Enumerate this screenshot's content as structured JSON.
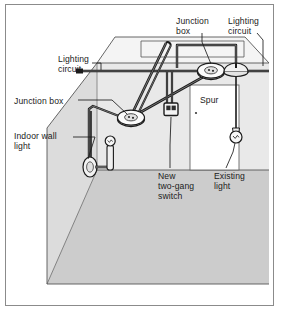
{
  "diagram": {
    "type": "isometric electrical installation diagram",
    "frame": {
      "border_color": "#8b8b8b",
      "background_color": "#ffffff"
    },
    "colors": {
      "wall_left": "#dcdcdc",
      "wall_back": "#e8e8e8",
      "floor": "#cccccc",
      "ceiling": "#f2f2f2",
      "line": "#1b1b1b",
      "cable": "#2a2a2a",
      "text": "#1b1b1b",
      "door_panel": "#ffffff"
    },
    "labels": [
      {
        "id": "junction-box-ceiling",
        "text": "Junction\nbox",
        "x": 176,
        "y": 16,
        "align": "left"
      },
      {
        "id": "lighting-circuit-right",
        "text": "Lighting\ncircuit",
        "x": 228,
        "y": 16,
        "align": "left"
      },
      {
        "id": "lighting-circuit-left",
        "text": "Lighting\ncircuit",
        "x": 58,
        "y": 54,
        "align": "left"
      },
      {
        "id": "junction-box-wall",
        "text": "Junction box",
        "x": 14,
        "y": 96,
        "align": "left"
      },
      {
        "id": "spur",
        "text": "Spur",
        "x": 200,
        "y": 95,
        "align": "left"
      },
      {
        "id": "indoor-wall-light",
        "text": "Indoor wall\nlight",
        "x": 14,
        "y": 131,
        "align": "left"
      },
      {
        "id": "new-two-gang-switch",
        "text": "New\ntwo-gang\nswitch",
        "x": 158,
        "y": 171,
        "align": "left"
      },
      {
        "id": "existing-light",
        "text": "Existing\nlight",
        "x": 214,
        "y": 171,
        "align": "left"
      }
    ],
    "components": [
      {
        "id": "junction-box-ceiling",
        "kind": "junction-box",
        "shape": "ellipse"
      },
      {
        "id": "junction-box-wall",
        "kind": "junction-box",
        "shape": "ellipse"
      },
      {
        "id": "ceiling-rose",
        "kind": "ceiling-rose",
        "shape": "dome"
      },
      {
        "id": "existing-pendant-light",
        "kind": "pendant-lamp",
        "shape": "bulb"
      },
      {
        "id": "indoor-wall-light",
        "kind": "wall-light",
        "shape": "bracket"
      },
      {
        "id": "two-gang-switch",
        "kind": "switch",
        "gangs": 2
      }
    ]
  }
}
